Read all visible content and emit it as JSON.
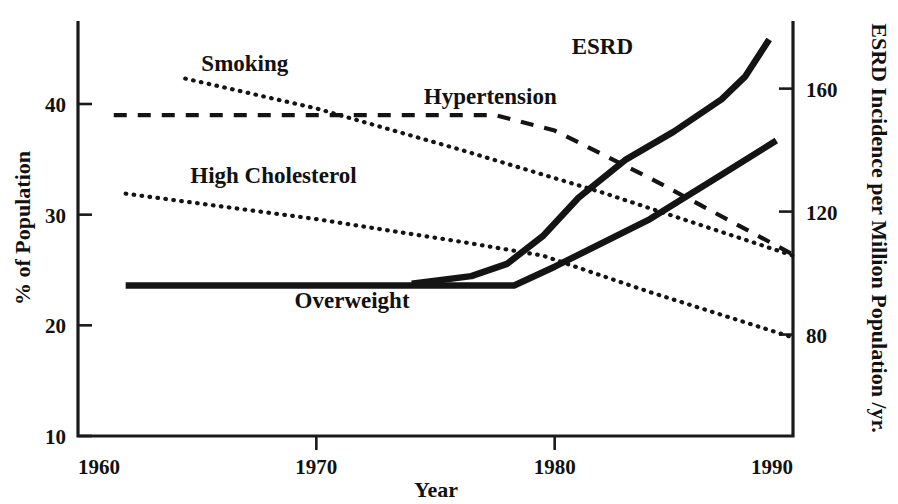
{
  "chart_data": {
    "type": "line",
    "title": "",
    "xlabel": "Year",
    "ylabel": "% of Population",
    "y2label": "ESRD Incidence per Million Population /yr.",
    "xlim": [
      1960,
      1990
    ],
    "ylim": [
      10,
      47.5
    ],
    "y2lim": [
      47.0,
      182.0
    ],
    "grid": false,
    "legend": "inline-labels",
    "x_ticks": [
      "1960",
      "1970",
      "1980",
      "1990"
    ],
    "x_tick_values": [
      1960,
      1970,
      1980,
      1990
    ],
    "y_ticks": [
      "10",
      "20",
      "30",
      "40"
    ],
    "y_tick_values": [
      10,
      20,
      30,
      40
    ],
    "y2_ticks": [
      "80",
      "120",
      "160"
    ],
    "y2_tick_values": [
      80,
      120,
      160
    ],
    "series": [
      {
        "name": "ESRD",
        "label": "ESRD",
        "axis": "right",
        "style": "solid-thick",
        "x": [
          1974.0,
          1976.5,
          1978.0,
          1979.5,
          1981.0,
          1983.0,
          1985.0,
          1987.0,
          1988.0,
          1989.0
        ],
        "values": [
          96.5,
          99.0,
          103.0,
          112.0,
          124.5,
          137.0,
          146.0,
          156.5,
          164.0,
          176.0
        ],
        "label_x": 1983.0,
        "label_y": 168.0
      },
      {
        "name": "Overweight",
        "label": "Overweight",
        "axis": "left",
        "style": "solid-thick",
        "x": [
          1962.0,
          1970.0,
          1976.0,
          1978.3,
          1980.0,
          1984.0,
          1987.0,
          1989.3
        ],
        "values": [
          23.6,
          23.6,
          23.6,
          23.6,
          25.3,
          29.6,
          33.6,
          36.7
        ],
        "label_x": 1972.0,
        "label_y": 21.5
      },
      {
        "name": "Hypertension",
        "label": "Hypertension",
        "axis": "left",
        "style": "dashed",
        "x": [
          1961.5,
          1970.0,
          1977.5,
          1980.0,
          1984.0,
          1990.0
        ],
        "values": [
          39.0,
          39.0,
          39.0,
          37.6,
          33.3,
          26.4
        ],
        "label_x": 1978.5,
        "label_y": 39.8
      },
      {
        "name": "Smoking",
        "label": "Smoking",
        "axis": "left",
        "style": "dotted",
        "x": [
          1964.5,
          1970.0,
          1976.0,
          1982.0,
          1990.0
        ],
        "values": [
          42.3,
          39.6,
          35.9,
          32.0,
          26.3
        ]
      },
      {
        "name": "High Cholesterol",
        "label": "High Cholesterol",
        "axis": "left",
        "style": "dotted",
        "x": [
          1962.0,
          1970.0,
          1976.5,
          1979.5,
          1984.0,
          1990.0
        ],
        "values": [
          31.9,
          29.6,
          27.4,
          26.3,
          23.0,
          18.9
        ]
      }
    ],
    "annotations": [
      {
        "text": "Smoking",
        "x": 1967.0,
        "y": 43.0,
        "name": "smoking"
      },
      {
        "text": "High Cholesterol",
        "x": 1968.2,
        "y": 32.9,
        "name": "high-cholesterol"
      },
      {
        "text": "Hypertension",
        "x": 1977.3,
        "y": 40.0,
        "name": "hypertension"
      },
      {
        "text": "Overweight",
        "x": 1971.5,
        "y": 21.6,
        "name": "overweight"
      },
      {
        "text": "ESRD",
        "x": 1982.0,
        "y": 44.5,
        "name": "esrd"
      }
    ]
  },
  "colors": {
    "ink": "#141414",
    "background": "#ffffff"
  }
}
